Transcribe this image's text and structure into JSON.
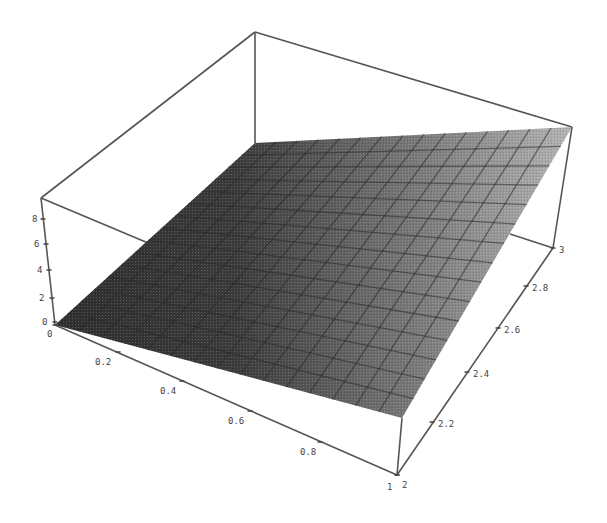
{
  "chart_data": {
    "type": "surface3d",
    "title": "",
    "function_hint": "z increases with x and y (approx. z = 3*x*y)",
    "x_axis": {
      "label": "",
      "range": [
        0,
        1
      ],
      "ticks": [
        "0",
        "0.2",
        "0.4",
        "0.6",
        "0.8",
        "1"
      ]
    },
    "y_axis": {
      "label": "",
      "range": [
        2,
        3
      ],
      "ticks": [
        "2",
        "2.2",
        "2.4",
        "2.6",
        "2.8",
        "3"
      ]
    },
    "z_axis": {
      "label": "",
      "range": [
        0,
        9
      ],
      "ticks": [
        "0",
        "2",
        "4",
        "6",
        "8"
      ]
    },
    "corners": [
      {
        "x": 0,
        "y": 2,
        "z": 0
      },
      {
        "x": 0,
        "y": 3,
        "z": 0
      },
      {
        "x": 1,
        "y": 2,
        "z": 6
      },
      {
        "x": 1,
        "y": 3,
        "z": 9
      }
    ],
    "mesh": {
      "rows": 15,
      "cols": 15
    },
    "shading": {
      "dark": "#2f2f2f",
      "light": "#b0b0b0"
    },
    "box": true,
    "grid": false,
    "legend": "none"
  },
  "axes": {
    "x_ticks": [
      {
        "label": "0",
        "tx": 55,
        "ty": 325,
        "lx": 47,
        "ly": 337
      },
      {
        "label": "0.2",
        "tx": 118,
        "ty": 352,
        "lx": 95,
        "ly": 365
      },
      {
        "label": "0.4",
        "tx": 182,
        "ty": 381,
        "lx": 160,
        "ly": 394
      },
      {
        "label": "0.6",
        "tx": 250,
        "ty": 411,
        "lx": 228,
        "ly": 424
      },
      {
        "label": "0.8",
        "tx": 320,
        "ty": 442,
        "lx": 300,
        "ly": 455
      },
      {
        "label": "1",
        "tx": 397,
        "ty": 475,
        "lx": 387,
        "ly": 490
      }
    ],
    "y_ticks": [
      {
        "label": "2",
        "tx": 397,
        "ty": 475,
        "lx": 402,
        "ly": 488
      },
      {
        "label": "2.2",
        "tx": 432,
        "ty": 422,
        "lx": 438,
        "ly": 427
      },
      {
        "label": "2.4",
        "tx": 467,
        "ty": 372,
        "lx": 473,
        "ly": 377
      },
      {
        "label": "2.6",
        "tx": 498,
        "ty": 328,
        "lx": 504,
        "ly": 333
      },
      {
        "label": "2.8",
        "tx": 526,
        "ty": 286,
        "lx": 532,
        "ly": 291
      },
      {
        "label": "3",
        "tx": 553,
        "ty": 248,
        "lx": 559,
        "ly": 253
      }
    ],
    "z_ticks": [
      {
        "label": "8",
        "tx": 43,
        "ty": 219,
        "lx": 32,
        "ly": 222
      },
      {
        "label": "6",
        "tx": 46,
        "ty": 244,
        "lx": 34,
        "ly": 247
      },
      {
        "label": "4",
        "tx": 49,
        "ty": 270,
        "lx": 37,
        "ly": 273
      },
      {
        "label": "2",
        "tx": 52,
        "ty": 298,
        "lx": 39,
        "ly": 301
      },
      {
        "label": "0",
        "tx": 55,
        "ty": 322,
        "lx": 42,
        "ly": 325
      }
    ]
  }
}
